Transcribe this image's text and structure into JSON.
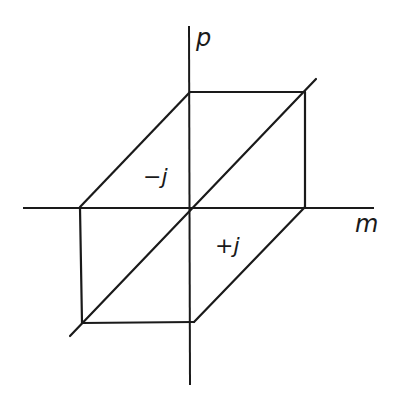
{
  "diagram": {
    "type": "parallelepiped projection on m-p axes",
    "axes": {
      "horizontal": {
        "label": "m",
        "from": [
          23,
          208
        ],
        "to": [
          374,
          208
        ]
      },
      "vertical": {
        "label": "p",
        "from": [
          189,
          26
        ],
        "to": [
          189,
          385
        ]
      }
    },
    "regions": [
      {
        "label": "−j",
        "position": "upper-left quadrant"
      },
      {
        "label": "+j",
        "position": "lower-right quadrant"
      }
    ],
    "stroke_color": "#1a1a1a",
    "background": "#ffffff"
  }
}
